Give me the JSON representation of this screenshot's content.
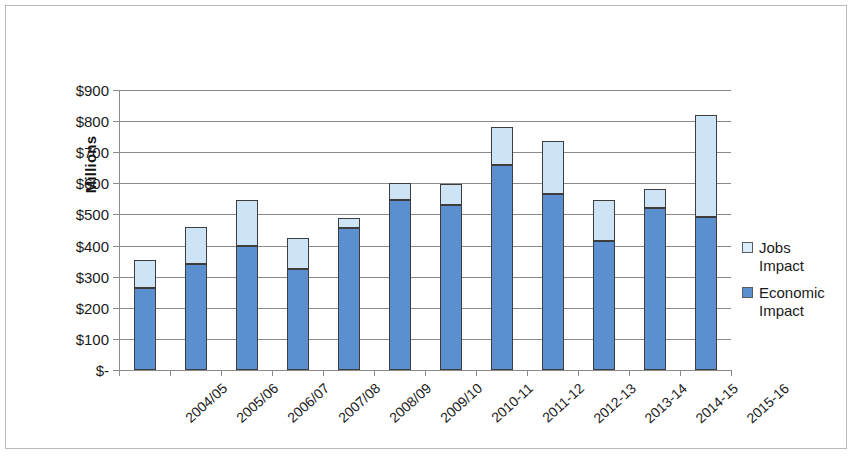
{
  "chart_data": {
    "type": "bar",
    "subtype": "stacked-column",
    "title": "",
    "xlabel": "",
    "ylabel": "Millions",
    "ylim": [
      0,
      900
    ],
    "ytick_step": 100,
    "ytick_labels": [
      "$900",
      "$800",
      "$700",
      "$600",
      "$500",
      "$400",
      "$300",
      "$200",
      "$100",
      "$-"
    ],
    "ytick_values": [
      900,
      800,
      700,
      600,
      500,
      400,
      300,
      200,
      100,
      0
    ],
    "grid": true,
    "legend_position": "right",
    "categories": [
      "2004/05",
      "2005/06",
      "2006/07",
      "2007/08",
      "2008/09",
      "2009/10",
      "2010-11",
      "2011-12",
      "2012-13",
      "2013-14",
      "2014-15",
      "2015-16"
    ],
    "series": [
      {
        "name": "Economic Impact",
        "color": "#5b8fd0",
        "values": [
          265,
          340,
          400,
          325,
          455,
          548,
          532,
          660,
          565,
          415,
          520,
          492
        ]
      },
      {
        "name": "Jobs Impact",
        "color": "#cce4f5",
        "values": [
          90,
          120,
          145,
          100,
          33,
          54,
          66,
          120,
          170,
          130,
          62,
          328
        ]
      }
    ],
    "totals": [
      355,
      460,
      545,
      425,
      488,
      602,
      598,
      780,
      735,
      545,
      582,
      820
    ]
  },
  "legend": {
    "entries": [
      {
        "label_line1": "Jobs",
        "label_line2": "Impact",
        "swatch": "jobs"
      },
      {
        "label_line1": "Economic",
        "label_line2": "Impact",
        "swatch": "economic"
      }
    ]
  },
  "axis": {
    "y_title": "Millions"
  },
  "colors": {
    "jobs_impact": "#cce4f5",
    "economic_impact": "#5b8fd0",
    "gridline": "#8a8a8a",
    "bar_outline": "#3d3d3d",
    "frame": "#b9b9b9"
  }
}
